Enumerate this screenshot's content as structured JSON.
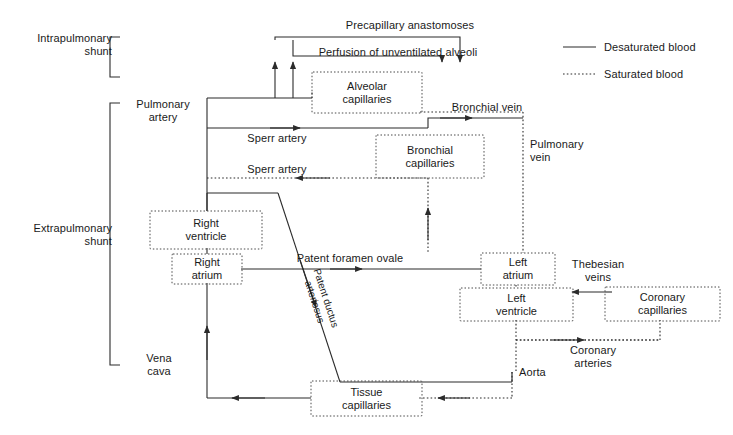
{
  "diagram": {
    "colors": {
      "line": "#2b2b2b",
      "text": "#1a1a1a",
      "background": "#ffffff",
      "dotted": "#4a4a4a"
    },
    "brackets": [
      {
        "name": "intrapulmonary-shunt",
        "label": "Intrapulmonary\nshunt"
      },
      {
        "name": "extrapulmonary-shunt",
        "label": "Extrapulmonary\nshunt"
      }
    ],
    "boxes": [
      {
        "id": "alveolar-capillaries",
        "label": "Alveolar\ncapillaries"
      },
      {
        "id": "bronchial-capillaries",
        "label": "Bronchial\ncapillaries"
      },
      {
        "id": "right-ventricle",
        "label": "Right\nventricle"
      },
      {
        "id": "right-atrium",
        "label": "Right\natrium"
      },
      {
        "id": "left-atrium",
        "label": "Left\natrium"
      },
      {
        "id": "left-ventricle",
        "label": "Left\nventricle"
      },
      {
        "id": "coronary-capillaries",
        "label": "Coronary\ncapillaries"
      },
      {
        "id": "tissue-capillaries",
        "label": "Tissue\ncapillaries"
      }
    ],
    "labels": {
      "precapillary_anastomoses": "Precapillary anastomoses",
      "perfusion_unventilated_alveoli": "Perfusion of unventilated alveoli",
      "pulmonary_artery": "Pulmonary\nartery",
      "sperr_artery_1": "Sperr artery",
      "sperr_artery_2": "Sperr artery",
      "bronchial_vein": "Bronchial vein",
      "pulmonary_vein": "Pulmonary\nvein",
      "patent_foramen_ovale": "Patent foramen ovale",
      "patent_ductus_arteriosus": "Patent ductus\narteriosus",
      "thebesian_veins": "Thebesian\nveins",
      "coronary_arteries": "Coronary\narteries",
      "aorta": "Aorta",
      "vena_cava": "Vena\ncava"
    },
    "legend": {
      "items": [
        {
          "id": "desaturated-blood",
          "label": "Desaturated blood",
          "style": "solid"
        },
        {
          "id": "saturated-blood",
          "label": "Saturated blood",
          "style": "dotted"
        }
      ]
    }
  }
}
